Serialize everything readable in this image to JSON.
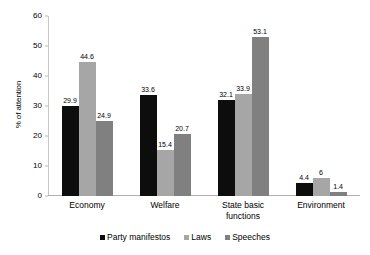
{
  "chart_data": {
    "type": "bar",
    "title": "",
    "subtitle": "",
    "xlabel": "",
    "ylabel": "% of attention",
    "ylim": [
      0,
      60
    ],
    "ytick_step": 10,
    "yticks": [
      0,
      10,
      20,
      30,
      40,
      50,
      60
    ],
    "ytick_labels": [
      "0",
      "10",
      "20",
      "30",
      "40",
      "50",
      "60"
    ],
    "grid": false,
    "legend_position": "bottom",
    "categories": [
      "Economy",
      "Welfare",
      "State basic functions",
      "Environment"
    ],
    "series": [
      {
        "name": "Party manifestos",
        "color": "#0d0d0d",
        "values": [
          29.9,
          33.6,
          32.1,
          4.4
        ],
        "labels": [
          "29.9",
          "33.6",
          "32.1",
          "4.4"
        ]
      },
      {
        "name": "Laws",
        "color": "#a6a6a6",
        "values": [
          44.6,
          15.4,
          33.9,
          6
        ],
        "labels": [
          "44.6",
          "15.4",
          "33.9",
          "6"
        ]
      },
      {
        "name": "Speeches",
        "color": "#808080",
        "values": [
          24.9,
          20.7,
          53.1,
          1.4
        ],
        "labels": [
          "24.9",
          "20.7",
          "53.1",
          "1.4"
        ]
      }
    ]
  }
}
